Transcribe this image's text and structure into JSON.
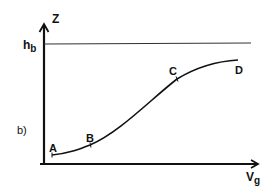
{
  "figure": {
    "panel_label": "b)",
    "axes": {
      "y_label": "Z",
      "x_label_main": "V",
      "x_label_sub": "g"
    },
    "reference_line": {
      "label_main": "h",
      "label_sub": "b"
    },
    "curve_points": [
      {
        "label": "A"
      },
      {
        "label": "B"
      },
      {
        "label": "C"
      },
      {
        "label": "D"
      }
    ],
    "colors": {
      "ink": "#111111",
      "reference_line": "#333333",
      "background": "#ffffff"
    }
  }
}
